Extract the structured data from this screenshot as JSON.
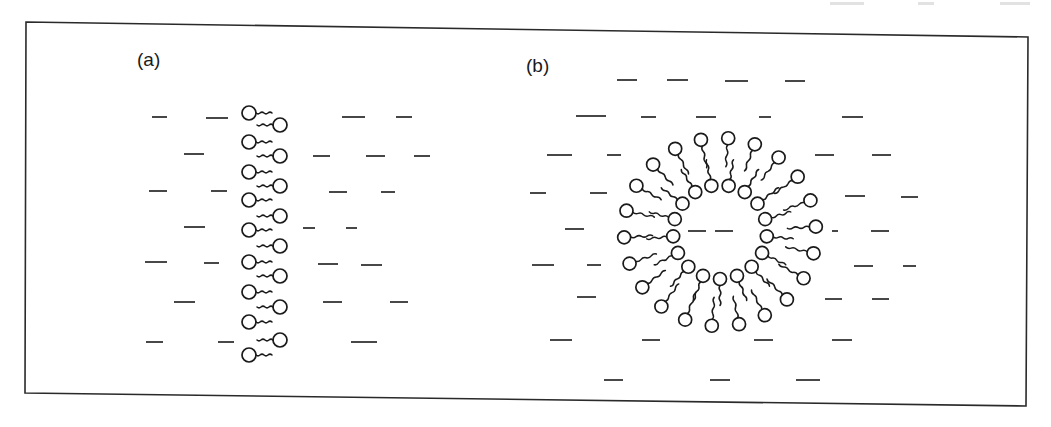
{
  "figure": {
    "panels": [
      {
        "id": "a",
        "label": "(a)",
        "structure": "planar-bilayer"
      },
      {
        "id": "b",
        "label": "(b)",
        "structure": "spherical-vesicle-bilayer"
      }
    ],
    "colors": {
      "ink": "#1a1a1a",
      "background": "#ffffff",
      "border": "#2a2a2a"
    },
    "border": {
      "points": [
        [
          26,
          22
        ],
        [
          1028,
          37
        ],
        [
          1026,
          406
        ],
        [
          25,
          393
        ]
      ]
    }
  },
  "panel_a": {
    "left_heads": [
      [
        249,
        113
      ],
      [
        249,
        142
      ],
      [
        249,
        172
      ],
      [
        249,
        200
      ],
      [
        249,
        230
      ],
      [
        249,
        262
      ],
      [
        249,
        292
      ],
      [
        249,
        322
      ],
      [
        249,
        355
      ]
    ],
    "right_heads": [
      [
        280,
        125
      ],
      [
        280,
        156
      ],
      [
        280,
        186
      ],
      [
        280,
        216
      ],
      [
        280,
        246
      ],
      [
        280,
        276
      ],
      [
        280,
        307
      ],
      [
        280,
        340
      ]
    ],
    "head_radius": 7,
    "dashes": [
      [
        152,
        117,
        167
      ],
      [
        206,
        118,
        228
      ],
      [
        342,
        117,
        365
      ],
      [
        396,
        117,
        412
      ],
      [
        184,
        154,
        204
      ],
      [
        313,
        156,
        330
      ],
      [
        366,
        156,
        385
      ],
      [
        414,
        156,
        430
      ],
      [
        149,
        191,
        167
      ],
      [
        211,
        191,
        227
      ],
      [
        329,
        192,
        347
      ],
      [
        381,
        192,
        395
      ],
      [
        184,
        227,
        205
      ],
      [
        303,
        228,
        315
      ],
      [
        346,
        228,
        357
      ],
      [
        145,
        262,
        167
      ],
      [
        204,
        263,
        219
      ],
      [
        318,
        264,
        338
      ],
      [
        361,
        265,
        382
      ],
      [
        174,
        302,
        195
      ],
      [
        323,
        302,
        342
      ],
      [
        390,
        302,
        408
      ],
      [
        146,
        342,
        163
      ],
      [
        218,
        342,
        234
      ],
      [
        351,
        342,
        377
      ]
    ]
  },
  "panel_b": {
    "center": [
      720,
      232
    ],
    "outer_radius": 96,
    "inner_radius": 47,
    "outer_count": 22,
    "inner_count": 17,
    "head_radius": 6.5,
    "dashes": [
      [
        617,
        80,
        637
      ],
      [
        667,
        80,
        688
      ],
      [
        725,
        81,
        748
      ],
      [
        785,
        81,
        805
      ],
      [
        576,
        116,
        606
      ],
      [
        641,
        117,
        656
      ],
      [
        696,
        117,
        716
      ],
      [
        759,
        117,
        771
      ],
      [
        842,
        117,
        863
      ],
      [
        547,
        155,
        572
      ],
      [
        607,
        155,
        621
      ],
      [
        815,
        155,
        834
      ],
      [
        872,
        155,
        891
      ],
      [
        530,
        193,
        546
      ],
      [
        590,
        193,
        607
      ],
      [
        845,
        196,
        865
      ],
      [
        901,
        197,
        918
      ],
      [
        565,
        229,
        584
      ],
      [
        688,
        231,
        706
      ],
      [
        715,
        231,
        733
      ],
      [
        832,
        231,
        838
      ],
      [
        871,
        231,
        889
      ],
      [
        532,
        265,
        554
      ],
      [
        587,
        265,
        601
      ],
      [
        854,
        266,
        873
      ],
      [
        903,
        266,
        916
      ],
      [
        577,
        297,
        596
      ],
      [
        825,
        299,
        842
      ],
      [
        872,
        299,
        889
      ],
      [
        550,
        340,
        572
      ],
      [
        642,
        340,
        660
      ],
      [
        754,
        340,
        773
      ],
      [
        832,
        340,
        852
      ],
      [
        604,
        380,
        623
      ],
      [
        710,
        380,
        730
      ],
      [
        796,
        380,
        820
      ]
    ]
  },
  "scan_artifacts": {
    "top_faint_marks": [
      [
        830,
        864
      ],
      [
        918,
        934
      ],
      [
        1000,
        1030
      ]
    ]
  }
}
